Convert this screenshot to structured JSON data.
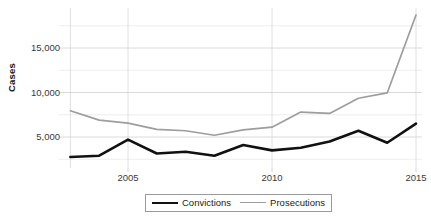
{
  "chart_data": {
    "type": "line",
    "title": "",
    "xlabel": "",
    "ylabel": "Cases",
    "x": [
      2003,
      2004,
      2005,
      2006,
      2007,
      2008,
      2009,
      2010,
      2011,
      2012,
      2013,
      2014,
      2015
    ],
    "xlim": [
      2002.6,
      2015.4
    ],
    "ylim": [
      0,
      20000
    ],
    "xticks": [
      2005,
      2010,
      2015
    ],
    "xtick_labels": [
      "2005",
      "2010",
      "2015"
    ],
    "yticks": [
      5000,
      10000,
      15000
    ],
    "ytick_labels": [
      "5,000",
      "10,000",
      "15,000"
    ],
    "minor_yticks": [
      2500,
      7500,
      12500,
      17500
    ],
    "grid": true,
    "legend_position": "bottom-center",
    "series": [
      {
        "name": "Convictions",
        "color": "#111111",
        "values": [
          2750,
          2900,
          4700,
          3150,
          3350,
          2900,
          4100,
          3500,
          3800,
          4500,
          5700,
          4350,
          6500
        ]
      },
      {
        "name": "Prosecutions",
        "color": "#9d9d9d",
        "values": [
          7950,
          6900,
          6550,
          5850,
          5700,
          5200,
          5800,
          6100,
          7800,
          7650,
          9350,
          9950,
          18700
        ]
      }
    ]
  },
  "axes": {
    "y_axis_title": "Cases",
    "y_tick_labels": [
      "15,000",
      "10,000",
      "5,000"
    ],
    "x_tick_labels": [
      "2005",
      "2010",
      "2015"
    ]
  },
  "legend": {
    "items": [
      {
        "label": "Convictions",
        "color": "#111111"
      },
      {
        "label": "Prosecutions",
        "color": "#9d9d9d"
      }
    ]
  }
}
